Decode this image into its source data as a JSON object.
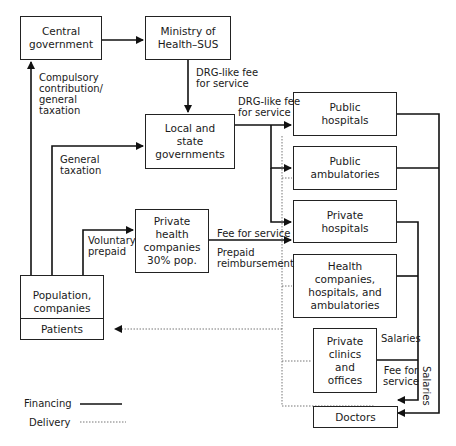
{
  "nodes": {
    "central_government": "Central\ngovernment",
    "ministry": "Ministry of\nHealth–SUS",
    "local_state": "Local and\nstate\ngovernments",
    "private_health_companies": "Private\nhealth\ncompanies\n30% pop.",
    "population": "Population,\ncompanies",
    "patients": "Patients",
    "public_hospitals": "Public\nhospitals",
    "public_ambulatories": "Public\nambulatories",
    "private_hospitals": "Private\nhospitals",
    "health_companies": "Health\ncompanies,\nhospitals, and\nambulatories",
    "private_clinics": "Private\nclinics\nand\noffices",
    "doctors": "Doctors"
  },
  "edge_labels": {
    "compulsory": "Compulsory\ncontribution/\ngeneral\ntaxation",
    "drg_ministry": "DRG-like fee\nfor service",
    "drg_local": "DRG-like fee\nfor service",
    "general_taxation": "General\ntaxation",
    "voluntary_prepaid": "Voluntary\nprepaid",
    "fee_for_service": "Fee for service",
    "prepaid_reimbursement": "Prepaid\nreimbursement",
    "salaries_inner": "Salaries",
    "fee_for_service_doctors": "Fee for\nservice",
    "salaries_outer": "Salaries"
  },
  "legend": {
    "financing": "Financing",
    "delivery": "Delivery"
  }
}
